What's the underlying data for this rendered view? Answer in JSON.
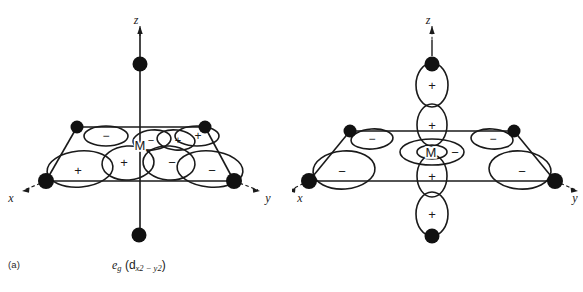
{
  "figure": {
    "background_color": "#ffffff",
    "ink_color": "#1a1a1a",
    "width": 583,
    "height": 292
  },
  "panels": [
    {
      "id": "a",
      "label": "(a)",
      "caption": {
        "orbital_symbol": "e",
        "orbital_subscript": "g",
        "open_paren": " (d",
        "descriptor_sub": "x2 − y2",
        "close_paren": ")"
      },
      "center_label": "M",
      "axes": [
        {
          "name": "x",
          "label": "x",
          "direction": "down-left"
        },
        {
          "name": "y",
          "label": "y",
          "direction": "down-right"
        },
        {
          "name": "z",
          "label": "z",
          "direction": "up"
        }
      ],
      "ligands": [
        {
          "name": "ligand-top-z",
          "x": 140,
          "y": 64,
          "r": 7.5
        },
        {
          "name": "ligand-bottom-z",
          "x": 139,
          "y": 235,
          "r": 7.5
        },
        {
          "name": "ligand-back-left",
          "x": 77,
          "y": 127,
          "r": 6.5
        },
        {
          "name": "ligand-back-right",
          "x": 205,
          "y": 127,
          "r": 6.5
        },
        {
          "name": "ligand-front-left",
          "x": 46,
          "y": 181,
          "r": 8.0
        },
        {
          "name": "ligand-front-right",
          "x": 234,
          "y": 181,
          "r": 8.0
        }
      ],
      "lobes": [
        {
          "name": "lobe-back-left",
          "sign": "−"
        },
        {
          "name": "lobe-inner-back-left",
          "sign": "−"
        },
        {
          "name": "lobe-inner-back-right",
          "sign": "+"
        },
        {
          "name": "lobe-back-right",
          "sign": "+"
        },
        {
          "name": "lobe-front-left",
          "sign": "+"
        },
        {
          "name": "lobe-inner-front-left",
          "sign": "+"
        },
        {
          "name": "lobe-inner-front-right",
          "sign": "−"
        },
        {
          "name": "lobe-front-right",
          "sign": "−"
        }
      ]
    },
    {
      "id": "b",
      "label": "(b)",
      "caption": {
        "orbital_symbol": "e",
        "orbital_subscript": "g",
        "open_paren": " (d",
        "descriptor_sub": "z2",
        "close_paren": ")"
      },
      "center_label": "M",
      "axes": [
        {
          "name": "x",
          "label": "x",
          "direction": "down-left"
        },
        {
          "name": "y",
          "label": "y",
          "direction": "down-right"
        },
        {
          "name": "z",
          "label": "z",
          "direction": "up"
        }
      ],
      "ligands": [
        {
          "name": "ligand-top-z",
          "x": 140,
          "y": 64,
          "r": 7.5
        },
        {
          "name": "ligand-bottom-z",
          "x": 140,
          "y": 236,
          "r": 7.5
        },
        {
          "name": "ligand-back-left",
          "x": 58,
          "y": 131,
          "r": 6.5
        },
        {
          "name": "ligand-back-right",
          "x": 222,
          "y": 131,
          "r": 6.5
        },
        {
          "name": "ligand-front-left",
          "x": 17,
          "y": 181,
          "r": 8.0
        },
        {
          "name": "ligand-front-right",
          "x": 263,
          "y": 181,
          "r": 8.0
        }
      ],
      "lobes": [
        {
          "name": "lobe-z-upper-outer",
          "sign": "+"
        },
        {
          "name": "lobe-z-upper-inner",
          "sign": "+"
        },
        {
          "name": "lobe-z-lower-inner",
          "sign": "+"
        },
        {
          "name": "lobe-z-lower-outer",
          "sign": "+"
        },
        {
          "name": "lobe-torus-right",
          "sign": "−"
        },
        {
          "name": "lobe-back-left",
          "sign": "−"
        },
        {
          "name": "lobe-back-right",
          "sign": "−"
        },
        {
          "name": "lobe-front-left",
          "sign": "−"
        },
        {
          "name": "lobe-front-right",
          "sign": "−"
        }
      ]
    }
  ]
}
